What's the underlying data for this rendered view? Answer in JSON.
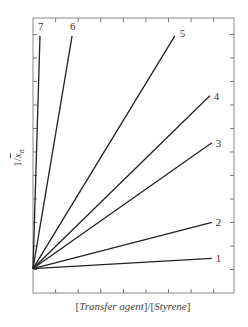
{
  "chart_data": {
    "type": "line",
    "title": "",
    "xlabel": "[Transfer agent]/[Styrene]",
    "xlabel_parts": {
      "open1": "[",
      "italic1": "Transfer agent",
      "mid": "]/[",
      "italic2": "Styrene",
      "close": "]"
    },
    "ylabel": "1/x̄n",
    "ylabel_parts": {
      "prefix": "1/",
      "var": "x",
      "sub": "n"
    },
    "xlim": [
      0,
      8.9
    ],
    "ylim": [
      0,
      11.7
    ],
    "grid": false,
    "ticks": "unlabeled, inward on all four sides",
    "intercept": 1.04,
    "series": [
      {
        "name": "1",
        "x": [
          0,
          7.92
        ],
        "y": [
          1.04,
          1.47
        ]
      },
      {
        "name": "2",
        "x": [
          0,
          7.92
        ],
        "y": [
          1.04,
          3.0
        ]
      },
      {
        "name": "3",
        "x": [
          0,
          7.92
        ],
        "y": [
          1.04,
          6.39
        ]
      },
      {
        "name": "4",
        "x": [
          0,
          7.83
        ],
        "y": [
          1.04,
          8.39
        ]
      },
      {
        "name": "5",
        "x": [
          0,
          6.28
        ],
        "y": [
          1.04,
          10.94
        ]
      },
      {
        "name": "6",
        "x": [
          0,
          1.73
        ],
        "y": [
          1.04,
          10.94
        ]
      },
      {
        "name": "7",
        "x": [
          0,
          0.31
        ],
        "y": [
          1.04,
          10.94
        ]
      }
    ],
    "line_labels": [
      "1",
      "2",
      "3",
      "4",
      "5",
      "6",
      "7"
    ],
    "legend": "none (lines labeled at ends)"
  }
}
